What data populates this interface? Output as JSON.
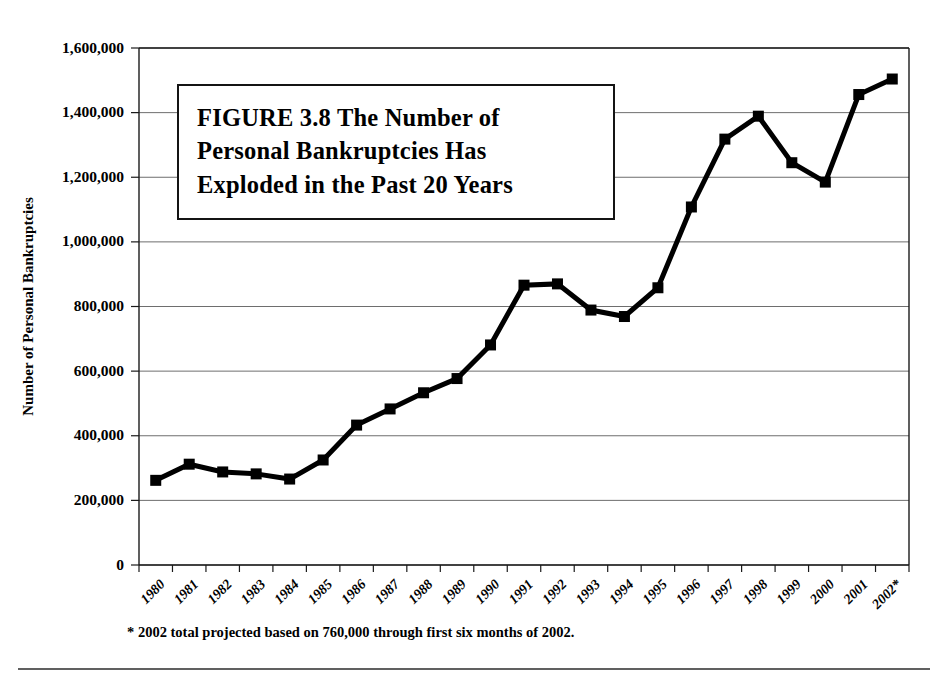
{
  "figure": {
    "title_lines": [
      "FIGURE 3.8  The Number of",
      "Personal Bankruptcies Has",
      "Exploded in the Past 20 Years"
    ],
    "footnote": "* 2002 total projected based on 760,000 through first six months of 2002."
  },
  "chart_data": {
    "type": "line",
    "title": "FIGURE 3.8  The Number of Personal Bankruptcies Has Exploded in the Past 20 Years",
    "xlabel": "",
    "ylabel": "Number of Personal Bankruptcies",
    "categories": [
      "1980",
      "1981",
      "1982",
      "1983",
      "1984",
      "1985",
      "1986",
      "1987",
      "1988",
      "1989",
      "1990",
      "1991",
      "1992",
      "1993",
      "1994",
      "1995",
      "1996",
      "1997",
      "1998",
      "1999",
      "2000",
      "2001",
      "2002*"
    ],
    "values": [
      262000,
      312000,
      288000,
      282000,
      266000,
      325000,
      433000,
      483000,
      533000,
      577000,
      681000,
      866000,
      870000,
      789000,
      769000,
      858000,
      1108000,
      1318000,
      1389000,
      1245000,
      1185000,
      1456000,
      1504000
    ],
    "ylim": [
      0,
      1600000
    ],
    "ytick_values": [
      0,
      200000,
      400000,
      600000,
      800000,
      1000000,
      1200000,
      1400000,
      1600000
    ],
    "ytick_labels": [
      "0",
      "200,000",
      "400,000",
      "600,000",
      "800,000",
      "1,000,000",
      "1,200,000",
      "1,400,000",
      "1,600,000"
    ],
    "grid": true,
    "legend": "none",
    "marker": "square",
    "marker_color": "#000000",
    "line_color": "#000000",
    "grid_color": "#6e6e6e",
    "axis_color": "#1a1a1a",
    "xtick_rotation": 45,
    "annotations": [
      "* 2002 total projected based on 760,000 through first six months of 2002."
    ]
  },
  "plot_geometry": {
    "left": 139,
    "right": 909,
    "top": 48,
    "bottom": 565
  }
}
